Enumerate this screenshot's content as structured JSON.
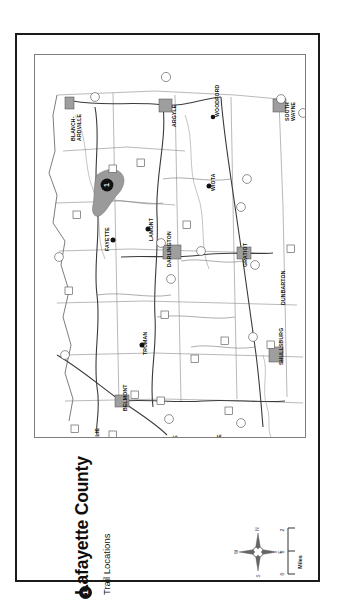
{
  "document": {
    "title": "Lafayette County",
    "orientation": "rotated-90-ccw"
  },
  "legend": {
    "marker_label": "1",
    "label": "Trail Locations"
  },
  "compass": {
    "north": "N",
    "south": "S",
    "east": "E",
    "west": "W"
  },
  "scalebar": {
    "ticks": [
      "0",
      "1",
      "2"
    ],
    "units": "Miles"
  },
  "map": {
    "county": "Lafayette County",
    "trail_markers": [
      {
        "id": "1",
        "label": "1",
        "near": "Yellowstone Lake",
        "x": 72,
        "y": 130
      },
      {
        "id": "2",
        "label": "2",
        "near": "Leslie",
        "x": 58,
        "y": 389
      }
    ],
    "towns": [
      {
        "name": "BLANCHARDVILLE",
        "line1": "BLANCH-",
        "line2": "ARDVILLE",
        "x": 54,
        "y": 86,
        "type": "village"
      },
      {
        "name": "ARGYLE",
        "x": 150,
        "y": 72,
        "type": "village"
      },
      {
        "name": "WOODFORD",
        "x": 190,
        "y": 62,
        "type": "hamlet"
      },
      {
        "name": "SOUTH WAYNE",
        "line1": "SOUTH",
        "line2": "WAYNE",
        "x": 258,
        "y": 75,
        "type": "village"
      },
      {
        "name": "WIOTA",
        "x": 186,
        "y": 133,
        "type": "hamlet"
      },
      {
        "name": "FAYETTE",
        "x": 88,
        "y": 183,
        "type": "hamlet"
      },
      {
        "name": "LAMONT",
        "x": 122,
        "y": 178,
        "type": "hamlet"
      },
      {
        "name": "DARLINGTON",
        "x": 140,
        "y": 199,
        "type": "city"
      },
      {
        "name": "GRATIOT",
        "x": 233,
        "y": 193,
        "type": "village"
      },
      {
        "name": "DUNBARTON",
        "x": 255,
        "y": 232,
        "type": "hamlet"
      },
      {
        "name": "TRUMAN",
        "x": 118,
        "y": 292,
        "type": "hamlet"
      },
      {
        "name": "SHULLSBURG",
        "x": 255,
        "y": 300,
        "type": "city"
      },
      {
        "name": "BELMONT",
        "x": 98,
        "y": 345,
        "type": "village"
      },
      {
        "name": "LESLIE",
        "x": 68,
        "y": 378,
        "type": "hamlet"
      },
      {
        "name": "ELK GROVE",
        "x": 148,
        "y": 389,
        "type": "hamlet"
      },
      {
        "name": "JENKYNSVILLE",
        "x": 192,
        "y": 398,
        "type": "hamlet"
      },
      {
        "name": "CUBA CITY",
        "x": 221,
        "y": 402,
        "type": "city"
      },
      {
        "name": "BENTON",
        "x": 258,
        "y": 401,
        "type": "village"
      }
    ],
    "features": [
      {
        "name": "Yellowstone Lake",
        "type": "lake"
      }
    ]
  }
}
